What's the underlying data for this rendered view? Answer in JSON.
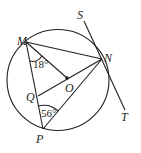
{
  "diagram": {
    "type": "circle-geometry",
    "points": {
      "M": "M",
      "N": "N",
      "O": "O",
      "P": "P",
      "Q": "Q",
      "S": "S",
      "T": "T"
    },
    "angles": {
      "OMQ": "18°",
      "QPN": "56°"
    }
  }
}
